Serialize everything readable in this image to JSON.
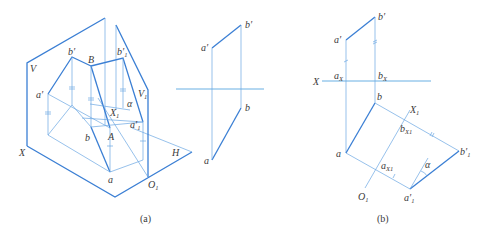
{
  "figure_a": {
    "caption": "(a)",
    "pictorial": {
      "plane_V": "V",
      "plane_V1": "V",
      "plane_V1_sub": "1",
      "plane_H": "H",
      "axis_X": "X",
      "axis_X1": "X",
      "axis_X1_sub": "1",
      "origin_O1": "O",
      "origin_O1_sub": "1",
      "point_A": "A",
      "point_B": "B",
      "a_prime": "a′",
      "b_prime": "b′",
      "b1_prime": "b′",
      "b1_prime_sub": "1",
      "a1_prime": "a′",
      "a1_prime_sub": "1",
      "a": "a",
      "b": "b",
      "angle": "α"
    },
    "projection": {
      "a_prime": "a′",
      "b_prime": "b′",
      "a": "a",
      "b": "b"
    }
  },
  "figure_b": {
    "caption": "(b)",
    "axis_X": "X",
    "a_prime": "a′",
    "b_prime": "b′",
    "a_x": "a",
    "a_x_sub": "X",
    "b_x": "b",
    "b_x_sub": "X",
    "a": "a",
    "b": "b",
    "axis_X1": "X",
    "axis_X1_sub": "1",
    "origin_O1": "O",
    "origin_O1_sub": "1",
    "b_x1": "b",
    "b_x1_sub": "X1",
    "a_x1": "a",
    "a_x1_sub": "X1",
    "b1_prime": "b′",
    "b1_prime_sub": "1",
    "a1_prime": "a′",
    "a1_prime_sub": "1",
    "angle": "α"
  },
  "colors": {
    "line_thick": "#3b7fd4",
    "line_thin": "#6aa6e2",
    "text": "#3a3a3a"
  }
}
